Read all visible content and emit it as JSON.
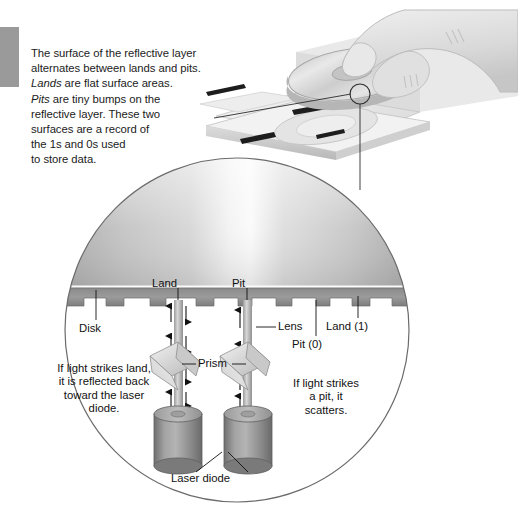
{
  "figure": {
    "caption": {
      "line1": "The surface of the reflective layer",
      "line2": "alternates between lands and pits.",
      "line3_em": "Lands",
      "line3_rest": " are flat surface areas.",
      "line4_em": "Pits",
      "line4_rest": " are tiny bumps on the",
      "line5": "reflective layer. These two",
      "line6": "surfaces are a record of",
      "line7": "the 1s and 0s used",
      "line8": "to store data."
    },
    "labels": {
      "land": "Land",
      "pit": "Pit",
      "disk": "Disk",
      "lens": "Lens",
      "prism": "Prism",
      "land_one": "Land (1)",
      "pit_zero": "Pit (0)",
      "laser_diode": "Laser diode"
    },
    "left_note": {
      "line1": "If light strikes land,",
      "line2": "it is reflected back",
      "line3": "toward the laser",
      "line4": "diode."
    },
    "right_note": {
      "line1": "If light strikes",
      "line2": "a pit, it",
      "line3": "scatters."
    },
    "colors": {
      "accent_bar": "#9a9a9a",
      "text": "#111111",
      "line": "#4a4a4a",
      "disc_dark": "#8d8d8d",
      "disc_light": "#e6e6e6",
      "drive_body": "#efefef",
      "drive_shade": "#d3d3d3",
      "hand_fill": "#e3e3e3",
      "cylinder": "#8b8b8b",
      "prism_fill": "#d9d9d9",
      "beam": "#b9b9b9",
      "magnifier_stroke": "#6b6b6b"
    }
  }
}
